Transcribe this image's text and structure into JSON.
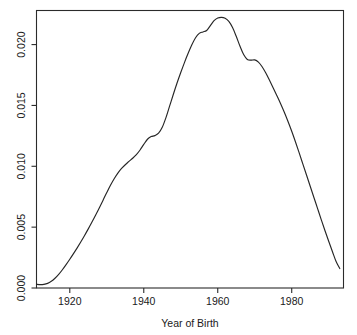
{
  "chart_data": {
    "type": "line",
    "title": "",
    "subtitle": "",
    "xlabel": "Year of Birth",
    "ylabel": "",
    "xlim": [
      1911,
      1994
    ],
    "ylim": [
      0.0,
      0.0228
    ],
    "grid": false,
    "legend": null,
    "x_ticks": [
      1920,
      1940,
      1960,
      1980
    ],
    "x_tick_labels": [
      "1920",
      "1940",
      "1960",
      "1980"
    ],
    "y_ticks": [
      0.0,
      0.005,
      0.01,
      0.015,
      0.02
    ],
    "y_tick_labels": [
      "0.000",
      "0.005",
      "0.010",
      "0.015",
      "0.020"
    ],
    "series": [
      {
        "name": "density",
        "x": [
          1911,
          1912,
          1913,
          1914,
          1915,
          1916,
          1917,
          1918,
          1919,
          1920,
          1921,
          1922,
          1923,
          1924,
          1925,
          1926,
          1927,
          1928,
          1929,
          1930,
          1931,
          1932,
          1933,
          1934,
          1935,
          1936,
          1937,
          1938,
          1939,
          1940,
          1941,
          1942,
          1943,
          1944,
          1945,
          1946,
          1947,
          1948,
          1949,
          1950,
          1951,
          1952,
          1953,
          1954,
          1955,
          1956,
          1957,
          1958,
          1959,
          1960,
          1961,
          1962,
          1963,
          1964,
          1965,
          1966,
          1967,
          1968,
          1969,
          1970,
          1971,
          1972,
          1973,
          1974,
          1975,
          1976,
          1977,
          1978,
          1979,
          1980,
          1981,
          1982,
          1983,
          1984,
          1985,
          1986,
          1987,
          1988,
          1989,
          1990,
          1991,
          1992,
          1993
        ],
        "y": [
          0.0003,
          0.00028,
          0.0003,
          0.00038,
          0.00055,
          0.0008,
          0.00112,
          0.0015,
          0.00192,
          0.00236,
          0.00282,
          0.0033,
          0.0038,
          0.00432,
          0.00486,
          0.00542,
          0.006,
          0.0066,
          0.00722,
          0.00784,
          0.00844,
          0.00898,
          0.00944,
          0.00982,
          0.01013,
          0.0104,
          0.01066,
          0.01096,
          0.01134,
          0.0118,
          0.01222,
          0.01244,
          0.01252,
          0.01272,
          0.0132,
          0.014,
          0.01496,
          0.01592,
          0.01684,
          0.0177,
          0.01852,
          0.01928,
          0.01998,
          0.02056,
          0.02092,
          0.02104,
          0.02116,
          0.02156,
          0.02196,
          0.02218,
          0.02224,
          0.02216,
          0.0219,
          0.0214,
          0.02068,
          0.01988,
          0.01918,
          0.01878,
          0.01872,
          0.01874,
          0.01856,
          0.01818,
          0.01766,
          0.01706,
          0.01644,
          0.0158,
          0.01514,
          0.01444,
          0.01368,
          0.01288,
          0.01202,
          0.01112,
          0.0102,
          0.00928,
          0.00836,
          0.00744,
          0.00652,
          0.0056,
          0.0047,
          0.00384,
          0.003,
          0.00218,
          0.0016
        ]
      }
    ],
    "annotations": [
      {
        "label": "peak",
        "x": 1961,
        "y": 0.02224
      },
      {
        "label": "shoulder-1943",
        "x": 1943,
        "y": 0.01252
      },
      {
        "label": "shoulder-1969",
        "x": 1969,
        "y": 0.01872
      }
    ]
  },
  "axis": {
    "x_title": "Year of Birth"
  },
  "colors": {
    "line": "#262626",
    "frame": "#2b2b2b",
    "background": "#ffffff",
    "text": "#1a1a1a"
  }
}
